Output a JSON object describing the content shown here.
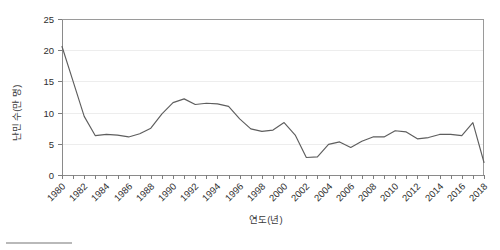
{
  "chart_data": {
    "type": "line",
    "title": "",
    "xlabel": "연도(년)",
    "ylabel": "난민 수(만 명)",
    "xlim": [
      1980,
      2018
    ],
    "ylim": [
      0,
      25
    ],
    "ytick_values": [
      0,
      5,
      10,
      15,
      20,
      25
    ],
    "xtick_labels": [
      "1980",
      "1982",
      "1984",
      "1986",
      "1988",
      "1990",
      "1992",
      "1994",
      "1996",
      "1998",
      "2000",
      "2002",
      "2004",
      "2006",
      "2008",
      "2010",
      "2012",
      "2014",
      "2016",
      "2018"
    ],
    "grid": "horizontal",
    "legend": "none",
    "line_color": "#5e5e5e",
    "series": [
      {
        "name": "난민 수",
        "x": [
          1980,
          1981,
          1982,
          1983,
          1984,
          1985,
          1986,
          1987,
          1988,
          1989,
          1990,
          1991,
          1992,
          1993,
          1994,
          1995,
          1996,
          1997,
          1998,
          1999,
          2000,
          2001,
          2002,
          2003,
          2004,
          2005,
          2006,
          2007,
          2008,
          2009,
          2010,
          2011,
          2012,
          2013,
          2014,
          2015,
          2016,
          2017,
          2018
        ],
        "values": [
          20.6,
          15.0,
          9.4,
          6.3,
          6.5,
          6.4,
          6.1,
          6.6,
          7.5,
          9.8,
          11.6,
          12.2,
          11.3,
          11.5,
          11.4,
          11.0,
          9.0,
          7.4,
          7.0,
          7.2,
          8.4,
          6.4,
          2.8,
          2.9,
          4.9,
          5.3,
          4.4,
          5.4,
          6.1,
          6.1,
          7.1,
          6.9,
          5.8,
          6.0,
          6.5,
          6.5,
          6.3,
          8.4,
          2.0
        ]
      }
    ]
  },
  "axes": {
    "y_title": "난민 수(만 명)",
    "x_title": "연도(년)"
  }
}
